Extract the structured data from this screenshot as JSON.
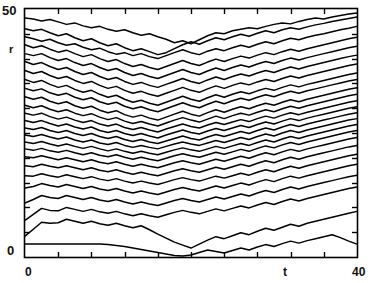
{
  "chart_data": {
    "type": "line",
    "title": "",
    "subtitle": "",
    "xlabel": "t",
    "ylabel": "r",
    "xlim": [
      0,
      40
    ],
    "ylim": [
      0,
      50
    ],
    "xticks": [
      0,
      4,
      8,
      12,
      16,
      20,
      24,
      28,
      32,
      36,
      40
    ],
    "yticks": [
      0,
      5,
      10,
      15,
      20,
      25,
      30,
      35,
      40,
      45,
      50
    ],
    "xtick_labels": [
      "0",
      "",
      "",
      "",
      "",
      "",
      "",
      "",
      "",
      "",
      "40"
    ],
    "ytick_labels": [
      "0",
      "",
      "",
      "",
      "",
      "",
      "",
      "",
      "",
      "",
      "50"
    ],
    "grid": false,
    "legend": false,
    "frame": true,
    "tick_direction": "in",
    "line_color": "#000000",
    "background_color": "#ffffff",
    "n_series": 25,
    "x": [
      0,
      1,
      2,
      3,
      4,
      5,
      6,
      7,
      8,
      9,
      10,
      11,
      12,
      13,
      14,
      15,
      16,
      17,
      18,
      19,
      20,
      21,
      22,
      23,
      24,
      25,
      26,
      27,
      28,
      29,
      30,
      31,
      32,
      33,
      34,
      35,
      36,
      37,
      38,
      39,
      40
    ],
    "series": [
      {
        "name": "r1",
        "values": [
          48.2,
          48.0,
          47.6,
          47.9,
          47.4,
          46.9,
          47.2,
          46.6,
          46.2,
          46.5,
          45.9,
          45.5,
          45.8,
          45.2,
          44.7,
          45.0,
          44.4,
          43.9,
          43.2,
          43.6,
          43.0,
          43.8,
          44.6,
          45.2,
          45.0,
          45.6,
          45.9,
          46.2,
          46.0,
          46.5,
          46.9,
          47.2,
          47.0,
          47.5,
          47.9,
          48.2,
          48.0,
          48.4,
          48.7,
          49.0,
          49.2
        ]
      },
      {
        "name": "r2",
        "values": [
          46.0,
          45.6,
          45.9,
          45.2,
          44.6,
          45.0,
          44.2,
          43.6,
          44.0,
          43.2,
          42.6,
          43.0,
          42.2,
          41.6,
          42.0,
          41.4,
          40.8,
          41.2,
          42.0,
          42.8,
          43.4,
          42.9,
          43.6,
          44.2,
          43.8,
          44.4,
          44.9,
          44.5,
          45.1,
          45.6,
          45.2,
          45.8,
          46.2,
          45.9,
          46.4,
          46.8,
          47.1,
          47.5,
          47.8,
          48.1,
          48.4
        ]
      },
      {
        "name": "r3",
        "values": [
          44.4,
          44.0,
          43.5,
          43.9,
          43.2,
          42.7,
          43.0,
          42.3,
          41.8,
          42.1,
          41.4,
          40.9,
          41.2,
          40.6,
          41.0,
          40.4,
          40.0,
          40.6,
          41.2,
          41.8,
          41.2,
          40.8,
          41.5,
          42.0,
          41.6,
          42.2,
          42.7,
          42.3,
          42.9,
          43.4,
          43.0,
          43.6,
          44.1,
          43.8,
          44.3,
          44.7,
          45.0,
          45.4,
          45.8,
          46.1,
          46.5
        ]
      },
      {
        "name": "r4",
        "values": [
          42.8,
          42.2,
          42.6,
          41.9,
          41.3,
          41.7,
          41.0,
          40.4,
          40.8,
          40.0,
          39.4,
          39.8,
          39.0,
          38.4,
          38.8,
          38.2,
          37.8,
          38.4,
          39.0,
          39.6,
          39.0,
          38.6,
          39.3,
          39.9,
          39.4,
          40.0,
          40.5,
          40.1,
          40.7,
          41.2,
          40.8,
          41.4,
          41.9,
          41.5,
          42.0,
          42.4,
          42.8,
          43.2,
          43.6,
          44.0,
          44.3
        ]
      },
      {
        "name": "r5",
        "values": [
          41.0,
          40.6,
          41.0,
          40.2,
          39.6,
          40.0,
          39.2,
          38.6,
          39.0,
          38.2,
          37.6,
          38.0,
          37.2,
          36.6,
          37.0,
          36.4,
          36.0,
          36.6,
          37.2,
          37.8,
          37.2,
          36.8,
          37.5,
          38.1,
          37.6,
          38.2,
          38.7,
          38.3,
          38.9,
          39.4,
          39.0,
          39.6,
          40.1,
          39.7,
          40.2,
          40.6,
          41.0,
          41.4,
          41.8,
          42.2,
          42.5
        ]
      },
      {
        "name": "r6",
        "values": [
          39.4,
          38.8,
          39.2,
          38.4,
          37.8,
          38.2,
          37.4,
          36.8,
          37.2,
          36.4,
          35.8,
          36.2,
          35.4,
          34.8,
          35.2,
          34.6,
          34.2,
          34.8,
          35.4,
          36.0,
          35.4,
          35.0,
          35.7,
          36.3,
          35.8,
          36.4,
          36.9,
          36.5,
          37.1,
          37.6,
          37.2,
          37.8,
          38.3,
          37.9,
          38.4,
          38.8,
          39.2,
          39.6,
          40.0,
          40.4,
          40.7
        ]
      },
      {
        "name": "r7",
        "values": [
          37.6,
          37.0,
          37.4,
          36.6,
          36.0,
          36.4,
          35.6,
          35.0,
          35.4,
          34.6,
          34.0,
          34.4,
          33.6,
          33.0,
          33.4,
          32.8,
          32.4,
          33.0,
          33.6,
          34.2,
          33.6,
          33.2,
          33.9,
          34.5,
          34.0,
          34.6,
          35.1,
          34.7,
          35.3,
          35.8,
          35.4,
          36.0,
          36.5,
          36.1,
          36.6,
          37.0,
          37.4,
          37.8,
          38.2,
          38.6,
          38.9
        ]
      },
      {
        "name": "r8",
        "values": [
          35.8,
          35.2,
          35.6,
          34.8,
          34.2,
          34.6,
          33.8,
          33.2,
          33.6,
          32.8,
          32.2,
          32.6,
          31.8,
          31.2,
          31.6,
          31.0,
          30.6,
          31.2,
          31.8,
          32.4,
          31.8,
          31.4,
          32.1,
          32.7,
          32.2,
          32.8,
          33.3,
          32.9,
          33.5,
          34.0,
          33.6,
          34.2,
          34.7,
          34.3,
          34.8,
          35.2,
          35.6,
          36.0,
          36.4,
          36.8,
          37.1
        ]
      },
      {
        "name": "r9",
        "values": [
          34.0,
          33.5,
          33.9,
          33.1,
          32.6,
          33.0,
          32.2,
          31.7,
          32.1,
          31.3,
          30.8,
          31.2,
          30.4,
          29.9,
          30.3,
          29.7,
          29.3,
          29.9,
          30.5,
          31.1,
          30.5,
          30.1,
          30.8,
          31.4,
          30.9,
          31.5,
          32.0,
          31.6,
          32.2,
          32.7,
          32.3,
          32.9,
          33.4,
          33.0,
          33.5,
          33.9,
          34.3,
          34.7,
          35.1,
          35.5,
          35.8
        ]
      },
      {
        "name": "r10",
        "values": [
          32.3,
          31.8,
          32.2,
          31.4,
          30.9,
          31.3,
          30.5,
          30.0,
          30.4,
          29.6,
          29.1,
          29.5,
          28.7,
          28.2,
          28.6,
          28.0,
          27.6,
          28.2,
          28.8,
          29.4,
          28.8,
          28.4,
          29.1,
          29.7,
          29.2,
          29.8,
          30.3,
          29.9,
          30.5,
          31.0,
          30.6,
          31.2,
          31.7,
          31.3,
          31.8,
          32.2,
          32.6,
          33.0,
          33.4,
          33.8,
          34.1
        ]
      },
      {
        "name": "r11",
        "values": [
          30.6,
          30.1,
          30.5,
          29.8,
          29.3,
          29.7,
          29.0,
          28.5,
          28.9,
          28.2,
          27.7,
          28.1,
          27.4,
          26.9,
          27.3,
          26.8,
          26.4,
          27.0,
          27.6,
          28.1,
          27.6,
          27.2,
          27.8,
          28.4,
          27.9,
          28.5,
          29.0,
          28.6,
          29.2,
          29.7,
          29.3,
          29.9,
          30.4,
          30.0,
          30.5,
          30.9,
          31.3,
          31.7,
          32.1,
          32.5,
          32.8
        ]
      },
      {
        "name": "r12",
        "values": [
          29.0,
          28.6,
          29.0,
          28.3,
          27.8,
          28.2,
          27.6,
          27.1,
          27.5,
          26.8,
          26.4,
          26.8,
          26.1,
          25.7,
          26.1,
          25.6,
          25.2,
          25.8,
          26.3,
          26.8,
          26.3,
          26.0,
          26.6,
          27.1,
          26.7,
          27.2,
          27.7,
          27.3,
          27.9,
          28.4,
          28.0,
          28.6,
          29.1,
          28.7,
          29.2,
          29.6,
          30.0,
          30.4,
          30.8,
          31.2,
          31.5
        ]
      },
      {
        "name": "r13",
        "values": [
          27.5,
          27.1,
          27.5,
          26.9,
          26.4,
          26.8,
          26.2,
          25.8,
          26.2,
          25.5,
          25.1,
          25.5,
          24.9,
          24.5,
          24.9,
          24.4,
          24.0,
          24.6,
          25.1,
          25.6,
          25.1,
          24.8,
          25.4,
          25.9,
          25.5,
          26.0,
          26.5,
          26.1,
          26.7,
          27.2,
          26.8,
          27.4,
          27.9,
          27.5,
          28.0,
          28.4,
          28.8,
          29.2,
          29.6,
          30.0,
          30.3
        ]
      },
      {
        "name": "r14",
        "values": [
          26.0,
          25.7,
          26.1,
          25.5,
          25.1,
          25.5,
          24.9,
          24.5,
          24.9,
          24.3,
          23.9,
          24.3,
          23.7,
          23.3,
          23.7,
          23.2,
          22.9,
          23.4,
          23.9,
          24.4,
          23.9,
          23.6,
          24.2,
          24.7,
          24.3,
          24.8,
          25.3,
          24.9,
          25.5,
          26.0,
          25.6,
          26.2,
          26.7,
          26.3,
          26.8,
          27.2,
          27.6,
          28.0,
          28.4,
          28.8,
          29.1
        ]
      },
      {
        "name": "r15",
        "values": [
          24.6,
          24.3,
          24.7,
          24.2,
          23.8,
          24.2,
          23.6,
          23.2,
          23.6,
          23.0,
          22.7,
          23.1,
          22.5,
          22.1,
          22.5,
          22.1,
          21.8,
          22.3,
          22.8,
          23.2,
          22.8,
          22.5,
          23.0,
          23.5,
          23.1,
          23.6,
          24.1,
          23.7,
          24.3,
          24.8,
          24.4,
          25.0,
          25.5,
          25.1,
          25.6,
          26.0,
          26.4,
          26.8,
          27.2,
          27.6,
          27.9
        ]
      },
      {
        "name": "r16",
        "values": [
          23.2,
          22.9,
          23.3,
          22.8,
          22.4,
          22.8,
          22.3,
          21.9,
          22.3,
          21.8,
          21.4,
          21.8,
          21.3,
          20.9,
          21.3,
          20.9,
          20.6,
          21.1,
          21.6,
          22.0,
          21.6,
          21.3,
          21.8,
          22.3,
          21.9,
          22.4,
          22.9,
          22.5,
          23.1,
          23.6,
          23.2,
          23.8,
          24.3,
          23.9,
          24.4,
          24.8,
          25.2,
          25.6,
          26.0,
          26.4,
          26.7
        ]
      },
      {
        "name": "r17",
        "values": [
          21.8,
          21.5,
          21.9,
          21.4,
          21.1,
          21.5,
          21.0,
          20.6,
          21.0,
          20.5,
          20.2,
          20.6,
          20.1,
          19.7,
          20.1,
          19.7,
          19.4,
          19.9,
          20.4,
          20.8,
          20.4,
          20.1,
          20.6,
          21.1,
          20.7,
          21.2,
          21.7,
          21.3,
          21.9,
          22.4,
          22.0,
          22.6,
          23.1,
          22.7,
          23.2,
          23.6,
          24.0,
          24.4,
          24.8,
          25.2,
          25.5
        ]
      },
      {
        "name": "r18",
        "values": [
          20.2,
          20.0,
          20.4,
          20.0,
          19.6,
          20.0,
          19.6,
          19.2,
          19.6,
          19.1,
          18.8,
          19.2,
          18.7,
          18.3,
          18.7,
          18.3,
          18.0,
          18.5,
          19.0,
          19.4,
          19.0,
          18.7,
          19.2,
          19.7,
          19.3,
          19.8,
          20.3,
          19.9,
          20.5,
          21.0,
          20.6,
          21.2,
          21.7,
          21.3,
          21.8,
          22.2,
          22.6,
          23.0,
          23.4,
          23.8,
          24.1
        ]
      },
      {
        "name": "r19",
        "values": [
          18.4,
          18.2,
          18.7,
          18.3,
          18.0,
          18.4,
          18.0,
          17.6,
          18.0,
          17.5,
          17.2,
          17.6,
          17.1,
          16.7,
          17.1,
          16.7,
          16.4,
          16.9,
          17.4,
          17.8,
          17.4,
          17.1,
          17.6,
          18.1,
          17.7,
          18.2,
          18.7,
          18.3,
          18.9,
          19.4,
          19.0,
          19.6,
          20.1,
          19.7,
          20.2,
          20.6,
          21.0,
          21.4,
          21.8,
          22.2,
          22.5
        ]
      },
      {
        "name": "r20",
        "values": [
          16.4,
          16.3,
          16.8,
          16.4,
          16.1,
          16.6,
          16.2,
          15.8,
          16.2,
          15.7,
          15.4,
          15.8,
          15.3,
          14.9,
          15.3,
          14.9,
          14.6,
          15.1,
          15.6,
          16.0,
          15.6,
          15.3,
          15.8,
          16.3,
          15.9,
          16.4,
          16.9,
          16.5,
          17.1,
          17.6,
          17.2,
          17.8,
          18.3,
          17.9,
          18.4,
          18.8,
          19.2,
          19.6,
          20.0,
          20.4,
          20.7
        ]
      },
      {
        "name": "r21",
        "values": [
          13.9,
          14.2,
          14.8,
          14.4,
          14.1,
          14.6,
          14.2,
          13.8,
          14.2,
          13.7,
          13.4,
          13.8,
          13.3,
          12.9,
          13.3,
          12.9,
          12.6,
          13.1,
          13.6,
          14.0,
          13.6,
          13.3,
          13.8,
          14.3,
          13.9,
          14.4,
          14.9,
          14.5,
          15.1,
          15.6,
          15.2,
          15.8,
          16.3,
          15.9,
          16.4,
          16.8,
          17.2,
          17.6,
          18.0,
          18.4,
          18.7
        ]
      },
      {
        "name": "r22",
        "values": [
          10.9,
          11.6,
          12.4,
          12.0,
          11.8,
          12.4,
          12.0,
          11.6,
          12.0,
          11.5,
          11.2,
          11.6,
          11.1,
          10.7,
          11.1,
          10.7,
          10.4,
          10.9,
          11.4,
          11.8,
          11.4,
          11.1,
          11.6,
          12.1,
          11.7,
          12.2,
          12.7,
          12.3,
          12.9,
          13.4,
          13.0,
          13.6,
          14.1,
          13.7,
          14.2,
          14.6,
          15.0,
          15.4,
          15.8,
          16.2,
          16.5
        ]
      },
      {
        "name": "r23",
        "values": [
          7.4,
          8.6,
          9.8,
          9.4,
          9.3,
          10.0,
          9.6,
          9.2,
          9.6,
          9.1,
          8.8,
          9.2,
          8.7,
          8.3,
          8.7,
          8.3,
          8.0,
          8.5,
          9.0,
          9.4,
          9.0,
          8.7,
          9.2,
          9.7,
          9.3,
          9.8,
          10.3,
          9.9,
          10.5,
          11.0,
          10.6,
          11.2,
          11.7,
          11.3,
          11.8,
          12.2,
          12.6,
          13.0,
          13.4,
          13.8,
          14.1
        ]
      },
      {
        "name": "r24",
        "values": [
          4.2,
          5.6,
          7.0,
          6.8,
          6.9,
          7.6,
          7.2,
          6.8,
          7.2,
          6.7,
          6.4,
          6.8,
          6.3,
          5.9,
          6.3,
          5.5,
          4.6,
          3.8,
          3.0,
          2.4,
          1.8,
          2.6,
          3.4,
          4.1,
          3.7,
          4.3,
          4.9,
          4.5,
          5.2,
          5.8,
          5.4,
          6.0,
          6.6,
          6.2,
          6.8,
          7.2,
          7.6,
          8.0,
          8.4,
          8.8,
          9.2
        ]
      },
      {
        "name": "r25",
        "values": [
          2.6,
          2.6,
          2.6,
          2.6,
          2.6,
          2.6,
          2.6,
          2.6,
          2.6,
          2.6,
          2.5,
          2.3,
          2.1,
          1.8,
          1.5,
          1.2,
          0.9,
          0.6,
          0.3,
          0.2,
          0.4,
          0.9,
          1.4,
          1.1,
          0.8,
          1.3,
          1.8,
          1.4,
          2.0,
          2.5,
          2.1,
          2.7,
          3.2,
          2.8,
          3.3,
          3.7,
          4.1,
          4.5,
          3.9,
          3.2,
          2.6
        ]
      }
    ]
  },
  "labels": {
    "y_top": "50",
    "y_bottom": "0",
    "y_axis": "r",
    "x_left": "0",
    "x_right": "40",
    "x_axis": "t"
  }
}
